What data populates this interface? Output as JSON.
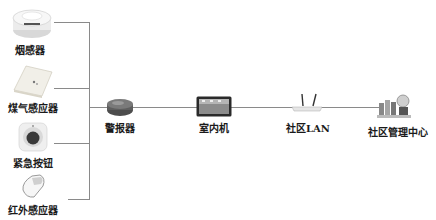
{
  "diagram": {
    "type": "network-topology",
    "sensors": [
      {
        "id": "smoke",
        "label": "烟感器",
        "icon": "smoke-detector-icon"
      },
      {
        "id": "gas",
        "label": "煤气感应器",
        "icon": "gas-sensor-icon"
      },
      {
        "id": "button",
        "label": "紧急按钮",
        "icon": "emergency-button-icon"
      },
      {
        "id": "ir",
        "label": "红外感应器",
        "icon": "infrared-sensor-icon"
      }
    ],
    "chain": [
      {
        "id": "alarm",
        "label": "警报器",
        "icon": "alarm-icon"
      },
      {
        "id": "indoor",
        "label": "室内机",
        "icon": "indoor-unit-icon"
      },
      {
        "id": "lan",
        "label": "社区LAN",
        "icon": "router-icon"
      },
      {
        "id": "center",
        "label": "社区管理中心",
        "icon": "management-center-icon"
      }
    ],
    "edges": [
      [
        "smoke",
        "alarm"
      ],
      [
        "gas",
        "alarm"
      ],
      [
        "button",
        "alarm"
      ],
      [
        "ir",
        "alarm"
      ],
      [
        "alarm",
        "indoor"
      ],
      [
        "indoor",
        "lan"
      ],
      [
        "lan",
        "center"
      ]
    ],
    "colors": {
      "line": "#8a8a8a",
      "text": "#1a1a1a",
      "background": "#ffffff"
    }
  }
}
